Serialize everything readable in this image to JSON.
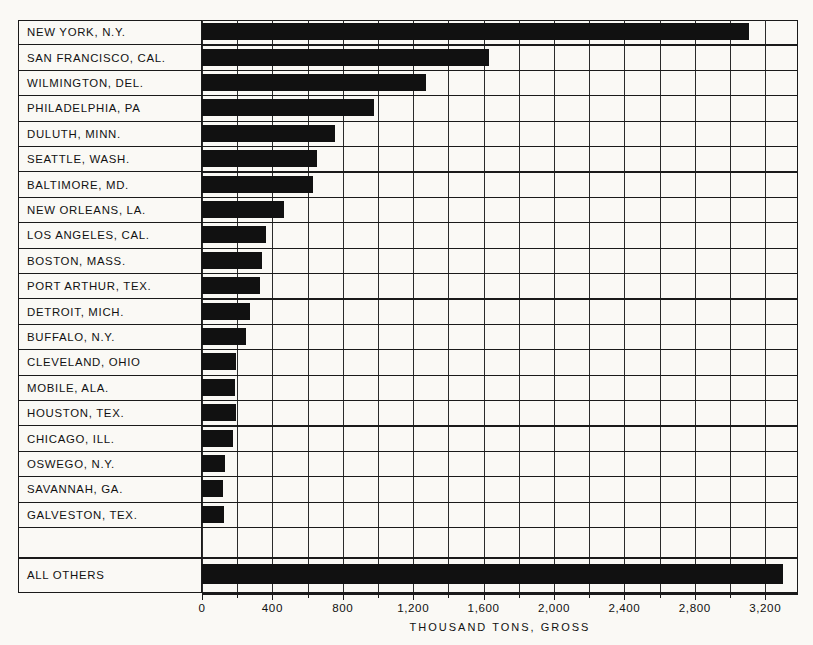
{
  "chart_data": {
    "type": "bar",
    "orientation": "horizontal",
    "title": "",
    "xlabel": "THOUSAND TONS, GROSS",
    "ylabel": "",
    "xlim": [
      0,
      3400
    ],
    "grid": true,
    "legend": null,
    "xticks": [
      "0",
      "400",
      "800",
      "1,200",
      "1,600",
      "2,000",
      "2,400",
      "2,800",
      "3,200"
    ],
    "xtick_values": [
      0,
      400,
      800,
      1200,
      1600,
      2000,
      2400,
      2800,
      3200
    ],
    "gridline_step": 200,
    "categories": [
      "NEW YORK, N.Y.",
      "SAN FRANCISCO, CAL.",
      "WILMINGTON, DEL.",
      "PHILADELPHIA, PA",
      "DULUTH, MINN.",
      "SEATTLE, WASH.",
      "BALTIMORE, MD.",
      "NEW ORLEANS, LA.",
      "LOS ANGELES, CAL.",
      "BOSTON, MASS.",
      "PORT ARTHUR, TEX.",
      "DETROIT, MICH.",
      "BUFFALO, N.Y.",
      "CLEVELAND, OHIO",
      "MOBILE, ALA.",
      "HOUSTON, TEX.",
      "CHICAGO, ILL.",
      "OSWEGO, N.Y.",
      "SAVANNAH, GA.",
      "GALVESTON, TEX.",
      "ALL OTHERS"
    ],
    "values": [
      3110,
      1630,
      1275,
      980,
      755,
      655,
      630,
      465,
      365,
      340,
      330,
      275,
      250,
      195,
      190,
      195,
      175,
      130,
      120,
      125,
      3300
    ],
    "units": "thousand tons, gross",
    "bar_color": "#111111"
  }
}
